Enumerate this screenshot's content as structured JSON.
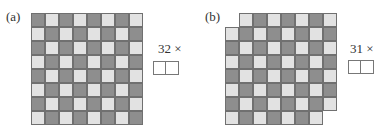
{
  "panels": [
    {
      "label": "(a)",
      "rows": 8,
      "cols": 8,
      "missing_cells": [],
      "multiplier_label": "32 ×",
      "answer_slots": 2
    },
    {
      "label": "(b)",
      "rows": 8,
      "cols": 8,
      "missing_cells": [
        [
          0,
          0
        ],
        [
          7,
          7
        ]
      ],
      "multiplier_label": "31 ×",
      "answer_slots": 2
    }
  ],
  "colors": {
    "dark_square": "#8e8e8e",
    "light_square": "#e2e2e2",
    "grid_line": "#707070"
  }
}
